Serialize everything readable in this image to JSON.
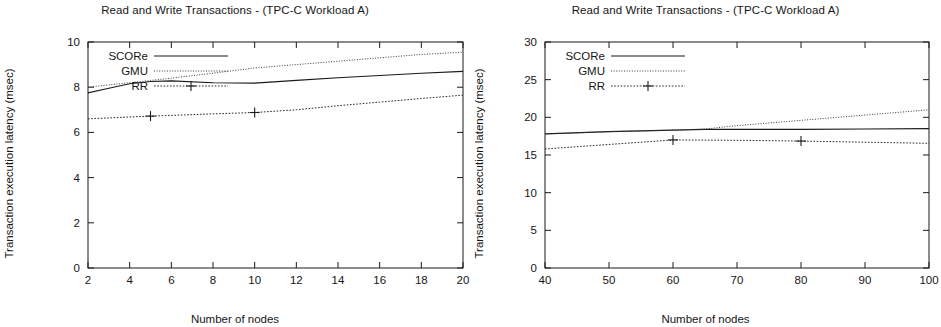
{
  "figure": {
    "panel_count": 2
  },
  "panels": [
    {
      "id": "left",
      "title": "Read and Write Transactions - (TPC-C Workload A)",
      "xlabel": "Number of nodes",
      "ylabel": "Transaction execution latency (msec)",
      "xticks": [
        "2",
        "4",
        "6",
        "8",
        "10",
        "12",
        "14",
        "16",
        "18",
        "20"
      ],
      "yticks": [
        "0",
        "2",
        "4",
        "6",
        "8",
        "10"
      ],
      "legend": [
        {
          "label": "SCORe",
          "style": "solid-line"
        },
        {
          "label": "GMU",
          "style": "fine-dotted-line"
        },
        {
          "label": "RR",
          "style": "dotted-line-with-plus-marker"
        }
      ]
    },
    {
      "id": "right",
      "title": "Read and Write Transactions - (TPC-C Workload A)",
      "xlabel": "Number of nodes",
      "ylabel": "Transaction execution latency (msec)",
      "xticks": [
        "40",
        "50",
        "60",
        "70",
        "80",
        "90",
        "100"
      ],
      "yticks": [
        "0",
        "5",
        "10",
        "15",
        "20",
        "25",
        "30"
      ],
      "legend": [
        {
          "label": "SCORe",
          "style": "solid-line"
        },
        {
          "label": "GMU",
          "style": "fine-dotted-line"
        },
        {
          "label": "RR",
          "style": "dotted-line-with-plus-marker"
        }
      ]
    }
  ],
  "chart_data": [
    {
      "type": "line",
      "panel": "left",
      "title": "Read and Write Transactions - (TPC-C Workload A)",
      "xlabel": "Number of nodes",
      "ylabel": "Transaction execution latency (msec)",
      "xlim": [
        2,
        20
      ],
      "ylim": [
        0,
        10
      ],
      "xticks": [
        2,
        4,
        6,
        8,
        10,
        12,
        14,
        16,
        18,
        20
      ],
      "yticks": [
        0,
        2,
        4,
        6,
        8,
        10
      ],
      "grid": false,
      "legend_position": "top-left-inside",
      "series": [
        {
          "name": "SCORe",
          "style": "solid",
          "marker": "none",
          "x": [
            2,
            3,
            4,
            5,
            6,
            8,
            10,
            12,
            14,
            16,
            18,
            20
          ],
          "y": [
            7.75,
            7.95,
            8.15,
            8.25,
            8.28,
            8.2,
            8.18,
            8.3,
            8.42,
            8.52,
            8.62,
            8.7
          ]
        },
        {
          "name": "GMU",
          "style": "fine-dotted",
          "marker": "none",
          "x": [
            2,
            3,
            4,
            5,
            6,
            8,
            10,
            12,
            14,
            16,
            18,
            20
          ],
          "y": [
            8.0,
            8.1,
            8.2,
            8.3,
            8.4,
            8.62,
            8.85,
            9.0,
            9.15,
            9.3,
            9.45,
            9.55
          ]
        },
        {
          "name": "RR",
          "style": "dotted",
          "marker": "plus",
          "marker_x": [
            5,
            10
          ],
          "marker_y": [
            6.72,
            6.88
          ],
          "x": [
            2,
            5,
            8,
            10,
            12,
            14,
            16,
            18,
            20
          ],
          "y": [
            6.6,
            6.72,
            6.82,
            6.88,
            7.0,
            7.18,
            7.34,
            7.5,
            7.65
          ]
        }
      ]
    },
    {
      "type": "line",
      "panel": "right",
      "title": "Read and Write Transactions - (TPC-C Workload A)",
      "xlabel": "Number of nodes",
      "ylabel": "Transaction execution latency (msec)",
      "xlim": [
        40,
        100
      ],
      "ylim": [
        0,
        30
      ],
      "xticks": [
        40,
        50,
        60,
        70,
        80,
        90,
        100
      ],
      "yticks": [
        0,
        5,
        10,
        15,
        20,
        25,
        30
      ],
      "grid": false,
      "legend_position": "top-left-inside",
      "series": [
        {
          "name": "SCORe",
          "style": "solid",
          "marker": "none",
          "x": [
            40,
            50,
            55,
            60,
            65,
            70,
            80,
            90,
            100
          ],
          "y": [
            17.8,
            18.1,
            18.2,
            18.3,
            18.4,
            18.4,
            18.4,
            18.45,
            18.5
          ]
        },
        {
          "name": "GMU",
          "style": "fine-dotted",
          "marker": "none",
          "x": [
            40,
            50,
            55,
            60,
            65,
            70,
            80,
            90,
            100
          ],
          "y": [
            17.8,
            18.1,
            18.2,
            18.3,
            18.45,
            18.9,
            19.6,
            20.3,
            21.0
          ]
        },
        {
          "name": "RR",
          "style": "dotted",
          "marker": "plus",
          "marker_x": [
            60,
            80
          ],
          "marker_y": [
            17.0,
            16.85
          ],
          "x": [
            40,
            50,
            60,
            70,
            80,
            90,
            100
          ],
          "y": [
            15.8,
            16.4,
            17.0,
            16.95,
            16.85,
            16.7,
            16.55
          ]
        }
      ]
    }
  ]
}
